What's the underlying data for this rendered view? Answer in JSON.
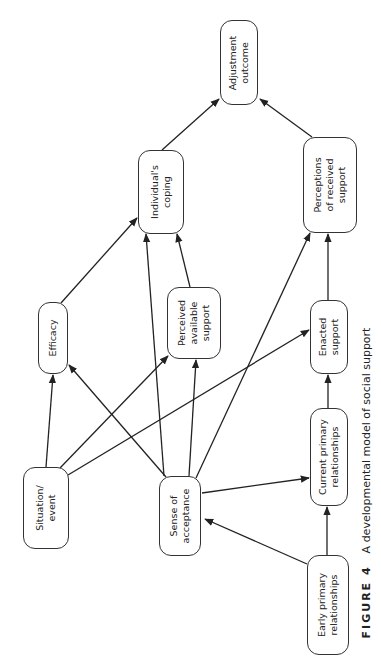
{
  "figure": {
    "label": "FIGURE 4",
    "title": "A developmental model of social support"
  },
  "nodes": {
    "adjustment_outcome": "Adjustment\noutcome",
    "individuals_coping": "Individual's\ncoping",
    "perceptions_received_support": "Perceptions\nof received\nsupport",
    "efficacy": "Efficacy",
    "perceived_available_support": "Perceived\navailable\nsupport",
    "enacted_support": "Enacted\nsupport",
    "situation_event": "Situation/\nevent",
    "sense_of_acceptance": "Sense of\nacceptance",
    "current_primary_relationships": "Current primary\nrelationships",
    "early_primary_relationships": "Early primary\nrelationships"
  },
  "edges": [
    {
      "from": "Individual's coping",
      "to": "Adjustment outcome"
    },
    {
      "from": "Perceptions of received support",
      "to": "Adjustment outcome"
    },
    {
      "from": "Efficacy",
      "to": "Individual's coping"
    },
    {
      "from": "Perceived available support",
      "to": "Individual's coping"
    },
    {
      "from": "Sense of acceptance",
      "to": "Individual's coping"
    },
    {
      "from": "Enacted support",
      "to": "Perceptions of received support"
    },
    {
      "from": "Sense of acceptance",
      "to": "Perceptions of received support"
    },
    {
      "from": "Situation/event",
      "to": "Efficacy"
    },
    {
      "from": "Sense of acceptance",
      "to": "Efficacy"
    },
    {
      "from": "Situation/event",
      "to": "Perceived available support"
    },
    {
      "from": "Sense of acceptance",
      "to": "Perceived available support"
    },
    {
      "from": "Situation/event",
      "to": "Enacted support"
    },
    {
      "from": "Current primary relationships",
      "to": "Enacted support"
    },
    {
      "from": "Sense of acceptance",
      "to": "Current primary relationships"
    },
    {
      "from": "Early primary relationships",
      "to": "Sense of acceptance"
    },
    {
      "from": "Early primary relationships",
      "to": "Current primary relationships"
    }
  ],
  "colors": {
    "stroke": "#333333",
    "background": "#ffffff",
    "text": "#222222"
  }
}
